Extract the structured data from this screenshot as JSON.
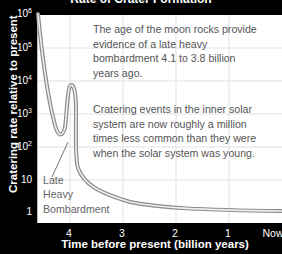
{
  "chart_data": {
    "type": "line",
    "title": "Rate of Crater Formation",
    "xlabel": "Time before present (billion years)",
    "ylabel": "Cratering rate relative to present",
    "x_ticks": [
      "4",
      "3",
      "2",
      "1",
      "Now"
    ],
    "y_ticks": [
      {
        "base": "10",
        "exp": "6"
      },
      {
        "base": "10",
        "exp": "5"
      },
      {
        "base": "10",
        "exp": "4"
      },
      {
        "base": "10",
        "exp": "3"
      },
      {
        "base": "10",
        "exp": "2"
      },
      {
        "base": "10",
        "exp": ""
      },
      {
        "base": "1",
        "exp": ""
      }
    ],
    "y_scale": "log",
    "ylim": [
      1,
      1000000
    ],
    "xlim": [
      4.6,
      0
    ],
    "grid": true,
    "series": [
      {
        "name": "Cratering rate",
        "x": [
          4.6,
          4.45,
          4.3,
          4.2,
          4.15,
          4.1,
          4.05,
          4.0,
          3.95,
          3.9,
          3.85,
          3.8,
          3.7,
          3.5,
          3.2,
          3.0,
          2.5,
          2.0,
          1.5,
          1.0,
          0.5,
          0
        ],
        "y": [
          1000000,
          30000,
          600,
          150,
          200,
          1500,
          5000,
          6000,
          3000,
          300,
          40,
          15,
          8,
          4,
          2.5,
          2,
          1.6,
          1.4,
          1.2,
          1.1,
          1.05,
          1
        ]
      }
    ],
    "annotations": [
      {
        "id": "moon_rocks",
        "lines": [
          "The age of the moon rocks provide",
          "evidence of a late heavy",
          "bombardment 4.1 to 3.8 billion",
          "years ago."
        ]
      },
      {
        "id": "cratering_events",
        "lines": [
          "Cratering events in the inner solar",
          "system are now roughly a million",
          "times less common than they were",
          "when the solar system was young."
        ]
      },
      {
        "id": "lhb_label",
        "lines": [
          "Late",
          "Heavy",
          "Bombardment"
        ]
      }
    ],
    "colors": {
      "background": "#000000",
      "plot_area": "#ffffff",
      "grid": "#d9d9d9",
      "curve_outer": "#888888",
      "curve_inner": "#eeeeee",
      "text": "#555555"
    }
  }
}
